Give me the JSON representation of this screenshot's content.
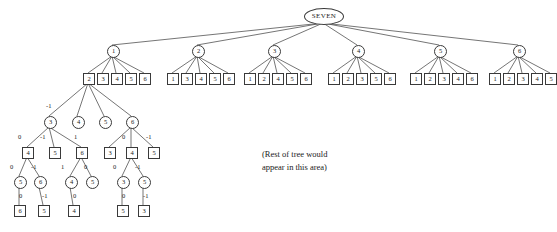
{
  "diagram": {
    "title_node": "SEVEN",
    "note_line1": "(Rest of tree would",
    "note_line2": "appear in this area)",
    "edge_color": "#3a3a3a",
    "node_fill": "#ffffff",
    "node_stroke": "#3a3a3a",
    "text_color": "#1a1a1a"
  },
  "root": {
    "label": "SEVEN",
    "x": 323,
    "y": 8
  },
  "level2": [
    {
      "label": "1",
      "x": 107,
      "y": 45
    },
    {
      "label": "2",
      "x": 192,
      "y": 45
    },
    {
      "label": "3",
      "x": 268,
      "y": 45
    },
    {
      "label": "4",
      "x": 352,
      "y": 45
    },
    {
      "label": "5",
      "x": 434,
      "y": 45
    },
    {
      "label": "6",
      "x": 513,
      "y": 45
    }
  ],
  "level3_groups": [
    {
      "parent": "1",
      "children": [
        "2",
        "3",
        "4",
        "5",
        "6"
      ],
      "xs": [
        83,
        97,
        111,
        125,
        139
      ],
      "y": 73
    },
    {
      "parent": "2",
      "children": [
        "1",
        "3",
        "4",
        "5",
        "6"
      ],
      "xs": [
        167,
        181,
        195,
        209,
        223
      ],
      "y": 73
    },
    {
      "parent": "3",
      "children": [
        "1",
        "2",
        "4",
        "5",
        "6"
      ],
      "xs": [
        244,
        258,
        272,
        286,
        300
      ],
      "y": 73
    },
    {
      "parent": "4",
      "children": [
        "1",
        "2",
        "3",
        "5",
        "6"
      ],
      "xs": [
        328,
        342,
        356,
        370,
        384
      ],
      "y": 73
    },
    {
      "parent": "5",
      "children": [
        "1",
        "2",
        "3",
        "4",
        "6"
      ],
      "xs": [
        410,
        424,
        438,
        452,
        466
      ],
      "y": 73
    },
    {
      "parent": "6",
      "children": [
        "1",
        "2",
        "3",
        "4",
        "5"
      ],
      "xs": [
        489,
        503,
        517,
        531,
        545
      ],
      "y": 73
    }
  ],
  "expanded_subtree": {
    "root_square": {
      "label": "2",
      "x": 83,
      "y": 73
    },
    "level4": [
      {
        "label": "3",
        "x": 44,
        "y": 116,
        "edge_label": "-1",
        "lx": 46,
        "ly": 102
      },
      {
        "label": "4",
        "x": 72,
        "y": 116,
        "edge_label": "",
        "lx": 0,
        "ly": 0
      },
      {
        "label": "5",
        "x": 99,
        "y": 116,
        "edge_label": "",
        "lx": 0,
        "ly": 0
      },
      {
        "label": "6",
        "x": 126,
        "y": 116,
        "edge_label": "",
        "lx": 0,
        "ly": 0
      }
    ],
    "level5": [
      {
        "label": "4",
        "x": 22,
        "y": 147,
        "edge_label": "0",
        "lx": 18,
        "ly": 133
      },
      {
        "label": "5",
        "x": 49,
        "y": 147,
        "edge_label": "-1",
        "lx": 40,
        "ly": 133
      },
      {
        "label": "6",
        "x": 76,
        "y": 147,
        "edge_label": "1",
        "lx": 74,
        "ly": 133
      },
      {
        "label": "3",
        "x": 104,
        "y": 147,
        "edge_label": "",
        "lx": 0,
        "ly": 0
      },
      {
        "label": "4",
        "x": 126,
        "y": 147,
        "edge_label": "0",
        "lx": 122,
        "ly": 133
      },
      {
        "label": "5",
        "x": 148,
        "y": 147,
        "edge_label": "-1",
        "lx": 146,
        "ly": 133
      }
    ],
    "level6": [
      {
        "label": "5",
        "x": 14,
        "y": 176,
        "edge_label": "0",
        "lx": 10,
        "ly": 163
      },
      {
        "label": "6",
        "x": 34,
        "y": 176,
        "edge_label": "-1",
        "lx": 31,
        "ly": 163
      },
      {
        "label": "4",
        "x": 65,
        "y": 176,
        "edge_label": "1",
        "lx": 61,
        "ly": 163
      },
      {
        "label": "5",
        "x": 86,
        "y": 176,
        "edge_label": "0",
        "lx": 84,
        "ly": 163
      },
      {
        "label": "3",
        "x": 117,
        "y": 176,
        "edge_label": "0",
        "lx": 113,
        "ly": 163
      },
      {
        "label": "5",
        "x": 138,
        "y": 176,
        "edge_label": "-1",
        "lx": 135,
        "ly": 163
      }
    ],
    "level7": [
      {
        "label": "6",
        "x": 14,
        "y": 205,
        "edge_label": "0",
        "lx": 19,
        "ly": 192
      },
      {
        "label": "5",
        "x": 38,
        "y": 205,
        "edge_label": "-1",
        "lx": 42,
        "ly": 192
      },
      {
        "label": "4",
        "x": 68,
        "y": 205,
        "edge_label": "0",
        "lx": 73,
        "ly": 192
      },
      {
        "label": "5",
        "x": 117,
        "y": 205,
        "edge_label": "0",
        "lx": 122,
        "ly": 192
      },
      {
        "label": "3",
        "x": 138,
        "y": 205,
        "edge_label": "-1",
        "lx": 143,
        "ly": 192
      }
    ]
  }
}
